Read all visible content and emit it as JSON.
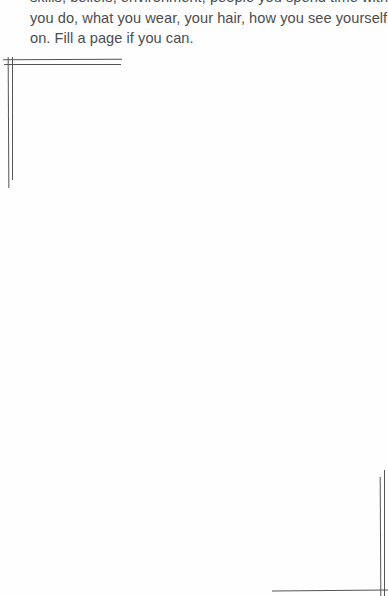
{
  "prompt": {
    "lines": [
      "skills, beliefs, environment, people you spend time with, things",
      "you do, what you wear, your hair, how you see yourself, and so",
      "on. Fill a page if you can."
    ]
  },
  "frame": {
    "style": "double-line hand-drawn corner brackets",
    "corners": [
      "top-left",
      "bottom-right"
    ],
    "line_color": "#555555"
  }
}
